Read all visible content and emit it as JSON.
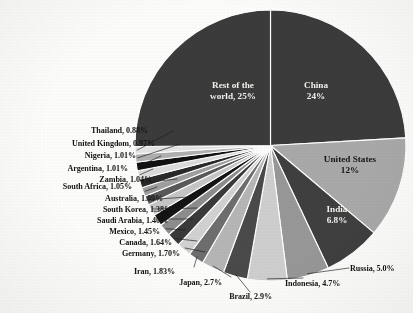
{
  "chart_data": {
    "type": "pie",
    "title": "",
    "subtitle": "",
    "xlabel": "",
    "ylabel": "",
    "legend_position": "none",
    "grid": false,
    "start_angle_deg": -90,
    "direction": "clockwise",
    "separator_color": "#ffffff",
    "categories": [
      "China",
      "United States",
      "India",
      "Russia",
      "Indonesia",
      "Brazil",
      "Japan",
      "Iran",
      "Germany",
      "Canada",
      "Mexico",
      "Saudi Arabia",
      "South Korea",
      "Australia",
      "South Africa",
      "Zambia",
      "Argentina",
      "Nigeria",
      "United Kingdom",
      "Thailand",
      "Rest of the world"
    ],
    "values": [
      24,
      12,
      6.8,
      5.0,
      4.7,
      2.9,
      2.7,
      1.83,
      1.7,
      1.64,
      1.45,
      1.4,
      1.38,
      1.09,
      1.05,
      1.04,
      1.01,
      1.01,
      0.97,
      0.88,
      25
    ],
    "value_labels": [
      "24%",
      "12%",
      "6.8%",
      "5.0%",
      "4.7%",
      "2.9%",
      "2.7%",
      "1.83%",
      "1.70%",
      "1.64%",
      "1.45%",
      "1.40%",
      "1.38%",
      "1.09%",
      "1.05%",
      "1.04%",
      "1.01%",
      "1.01%",
      "0.97%",
      "0.88%",
      "25%"
    ],
    "slice_colors": [
      "#3b3b3b",
      "#a9a9a9",
      "#3f3f3f",
      "#989898",
      "#cfcfcf",
      "#4a4a4a",
      "#b6b6b6",
      "#6e6e6e",
      "#d2d2d2",
      "#3a3a3a",
      "#8d8d8d",
      "#141414",
      "#c6c6c6",
      "#5a5a5a",
      "#9f9f9f",
      "#2a2a2a",
      "#dcdcdc",
      "#111111",
      "#b0b0b0",
      "#e4e4e4",
      "#3b3b3b"
    ]
  },
  "slices": [
    {
      "name": "china",
      "label": "China",
      "value_label": "24%",
      "label_text": "China",
      "placement": "inside",
      "text_color": "white"
    },
    {
      "name": "united-states",
      "label": "United States",
      "value_label": "12%",
      "label_text": "United States",
      "placement": "inside",
      "text_color": "dark"
    },
    {
      "name": "india",
      "label": "India",
      "value_label": "6.8%",
      "label_text": "India",
      "placement": "inside",
      "text_color": "white"
    },
    {
      "name": "russia",
      "label": "Russia",
      "value_label": "5.0%",
      "label_text": "Russia, 5.0%",
      "placement": "outside",
      "side": "right"
    },
    {
      "name": "indonesia",
      "label": "Indonesia",
      "value_label": "4.7%",
      "label_text": "Indonesia, 4.7%",
      "placement": "outside",
      "side": "bottom"
    },
    {
      "name": "brazil",
      "label": "Brazil",
      "value_label": "2.9%",
      "label_text": "Brazil, 2.9%",
      "placement": "outside",
      "side": "bottom"
    },
    {
      "name": "japan",
      "label": "Japan",
      "value_label": "2.7%",
      "label_text": "Japan, 2.7%",
      "placement": "outside",
      "side": "bottom"
    },
    {
      "name": "iran",
      "label": "Iran",
      "value_label": "1.83%",
      "label_text": "Iran, 1.83%",
      "placement": "outside",
      "side": "left"
    },
    {
      "name": "germany",
      "label": "Germany",
      "value_label": "1.70%",
      "label_text": "Germany, 1.70%",
      "placement": "outside",
      "side": "left"
    },
    {
      "name": "canada",
      "label": "Canada",
      "value_label": "1.64%",
      "label_text": "Canada, 1.64%",
      "placement": "outside",
      "side": "left"
    },
    {
      "name": "mexico",
      "label": "Mexico",
      "value_label": "1.45%",
      "label_text": "Mexico, 1.45%",
      "placement": "outside",
      "side": "left"
    },
    {
      "name": "saudi-arabia",
      "label": "Saudi Arabia",
      "value_label": "1.40%",
      "label_text": "Saudi Arabia, 1.40%",
      "placement": "outside",
      "side": "left"
    },
    {
      "name": "south-korea",
      "label": "South Korea",
      "value_label": "1.38%",
      "label_text": "South Korea, 1.38%",
      "placement": "outside",
      "side": "left"
    },
    {
      "name": "australia",
      "label": "Australia",
      "value_label": "1.09%",
      "label_text": "Australia, 1.09%",
      "placement": "outside",
      "side": "left"
    },
    {
      "name": "south-africa",
      "label": "South Africa",
      "value_label": "1.05%",
      "label_text": "South Africa, 1.05%",
      "placement": "outside",
      "side": "left"
    },
    {
      "name": "zambia",
      "label": "Zambia",
      "value_label": "1.04%",
      "label_text": "Zambia, 1.04%",
      "placement": "outside",
      "side": "left"
    },
    {
      "name": "argentina",
      "label": "Argentina",
      "value_label": "1.01%",
      "label_text": "Argentina, 1.01%",
      "placement": "outside",
      "side": "left"
    },
    {
      "name": "nigeria",
      "label": "Nigeria",
      "value_label": "1.01%",
      "label_text": "Nigeria, 1.01%",
      "placement": "outside",
      "side": "left"
    },
    {
      "name": "united-kingdom",
      "label": "United Kingdom",
      "value_label": "0.97%",
      "label_text": "United Kingdom, 0.97%",
      "placement": "outside",
      "side": "left"
    },
    {
      "name": "thailand",
      "label": "Thailand",
      "value_label": "0.88%",
      "label_text": "Thailand, 0.88%",
      "placement": "outside",
      "side": "left"
    },
    {
      "name": "rest-of-world",
      "label": "Rest of the world",
      "value_label": "25%",
      "label_text": "Rest of the",
      "label_text2": "world, 25%",
      "placement": "inside",
      "text_color": "white"
    }
  ],
  "inside_labels": {
    "rest_line1": "Rest of the",
    "rest_line2": "world, 25%",
    "china_line1": "China",
    "china_line2": "24%",
    "us_line1": "United States",
    "us_line2": "12%",
    "india_line1": "India",
    "india_line2": "6.8%"
  }
}
